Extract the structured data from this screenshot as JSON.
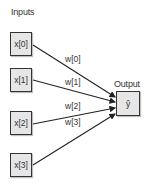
{
  "diagram": {
    "inputs_label": "Inputs",
    "output_label": "Output",
    "inputs": [
      {
        "label": "x[0]",
        "weight": "w[0]"
      },
      {
        "label": "x[1]",
        "weight": "w[1]"
      },
      {
        "label": "x[2]",
        "weight": "w[2]"
      },
      {
        "label": "x[3]",
        "weight": "w[3]"
      }
    ],
    "output": {
      "label": "ŷ"
    },
    "colors": {
      "box_fill": "#e6e6e6",
      "stroke": "#333333"
    }
  }
}
